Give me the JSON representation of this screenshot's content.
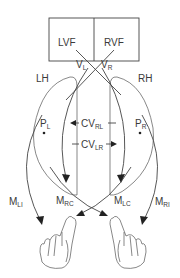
{
  "diagram": {
    "type": "split-brain visuomotor pathway schematic",
    "visual_field": {
      "left_label": "LVF",
      "right_label": "RVF"
    },
    "visual_inputs": {
      "left": {
        "main": "V",
        "sub": "L"
      },
      "right": {
        "main": "V",
        "sub": "R"
      }
    },
    "hemispheres": {
      "left": "LH",
      "right": "RH"
    },
    "premotor": {
      "left": {
        "main": "P",
        "sub": "L"
      },
      "right": {
        "main": "P",
        "sub": "R"
      }
    },
    "callosal_transfer": {
      "right_to_left": {
        "main": "CV",
        "sub": "RL"
      },
      "left_to_right": {
        "main": "CV",
        "sub": "LR"
      }
    },
    "motor_outputs": {
      "left_ipsilateral": {
        "main": "M",
        "sub": "LI"
      },
      "right_contralateral": {
        "main": "M",
        "sub": "RC"
      },
      "left_contralateral": {
        "main": "M",
        "sub": "LC"
      },
      "right_ipsilateral": {
        "main": "M",
        "sub": "RI"
      }
    },
    "effectors": [
      "left-hand",
      "right-hand"
    ],
    "colors": {
      "line": "#444444",
      "text": "#3a3a3a",
      "background": "#ffffff"
    }
  }
}
